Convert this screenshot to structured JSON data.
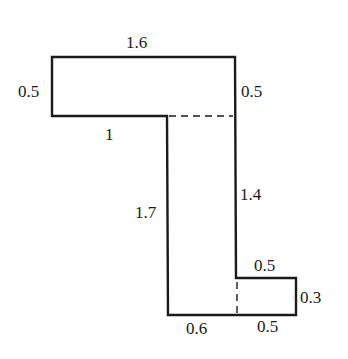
{
  "diagram": {
    "type": "composite rectilinear shape with dimensions",
    "shape": {
      "outline_color": "#1a1a1a",
      "background": "#ffffff"
    },
    "labels": {
      "top_width": "1.6",
      "left_top_height": "0.5",
      "right_top_height": "0.5",
      "inner_ledge_width": "1",
      "inner_vertical_height": "1.7",
      "right_vertical_height": "1.4",
      "step_top_width": "0.5",
      "step_height": "0.3",
      "bottom_left_width": "0.6",
      "bottom_right_width": "0.5"
    },
    "dashed_lines": [
      {
        "name": "horizontal-divider",
        "description": "separates top bar from vertical column"
      },
      {
        "name": "vertical-divider",
        "description": "separates vertical column from bottom step"
      }
    ]
  }
}
